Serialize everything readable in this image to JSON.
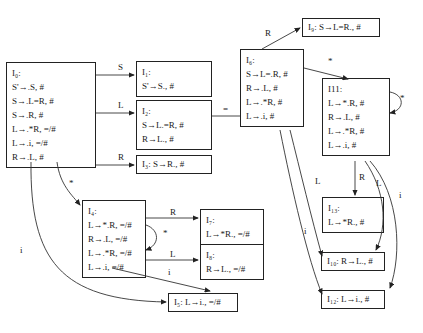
{
  "states": {
    "I0": {
      "title": "I₀:",
      "items": [
        "S'→.S, #",
        "S→.L=R, #",
        "S→.R, #",
        "L→.*R, =/#",
        "L→.i, =/#",
        "R→.L, #"
      ]
    },
    "I1": {
      "title": "I₁:",
      "items": [
        "S'→S., #"
      ]
    },
    "I2": {
      "title": "I₂:",
      "items": [
        "S→L.=R, #",
        "R→L., #"
      ]
    },
    "I3": {
      "inline": "I₃: S→R., #"
    },
    "I4": {
      "title": "I₄:",
      "items": [
        "L→*.R, =/#",
        "R→.L, =/#",
        "L→.*R, =/#",
        "L→.i, =/#"
      ]
    },
    "I5": {
      "inline": "I₅: L→i., =/#"
    },
    "I6": {
      "title": "I₆:",
      "items": [
        "S→L=.R, #",
        "R→.L, #",
        "L→.*R, #",
        "L→.i, #"
      ]
    },
    "I7": {
      "title": "I₇:",
      "items": [
        "L→*R., =/#"
      ]
    },
    "I8": {
      "title": "I₈:",
      "items": [
        "R→L., =/#"
      ]
    },
    "I9": {
      "inline": "I₉: S→L=R., #"
    },
    "I10": {
      "inline": "I₁₀: R→L., #"
    },
    "I11": {
      "title": "I11:",
      "items": [
        "L→*.R, #",
        "R→.L, #",
        "L→.*R, #",
        "L→.i, #"
      ]
    },
    "I12": {
      "inline": "I₁₂: L→i., #"
    },
    "I13": {
      "title": "I₁₃:",
      "items": [
        "L→*R., #"
      ]
    }
  },
  "edge_labels": {
    "I0_I1": "S",
    "I0_I2": "L",
    "I0_I3": "R",
    "I0_I4": "*",
    "I0_I5": "i",
    "I2_I6": "=",
    "I6_I9": "R",
    "I6_I11": "*",
    "I6_I10": "L",
    "I6_I12": "i",
    "I4_I7": "R",
    "I4_I4": "*",
    "I4_I8": "L",
    "I4_I5": "i",
    "I11_I11": "*",
    "I11_I13": "R",
    "I11_I10": "L",
    "I11_I12": "i"
  }
}
